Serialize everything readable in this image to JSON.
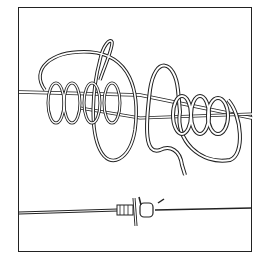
{
  "illustration": {
    "subject": "knot-tying diagram",
    "panels": [
      {
        "name": "upper",
        "description": "two lines with coiled wraps, loose"
      },
      {
        "name": "lower",
        "description": "finished knot pulled tight on line"
      }
    ],
    "colors": {
      "stroke": "#222222",
      "background": "#ffffff"
    }
  }
}
